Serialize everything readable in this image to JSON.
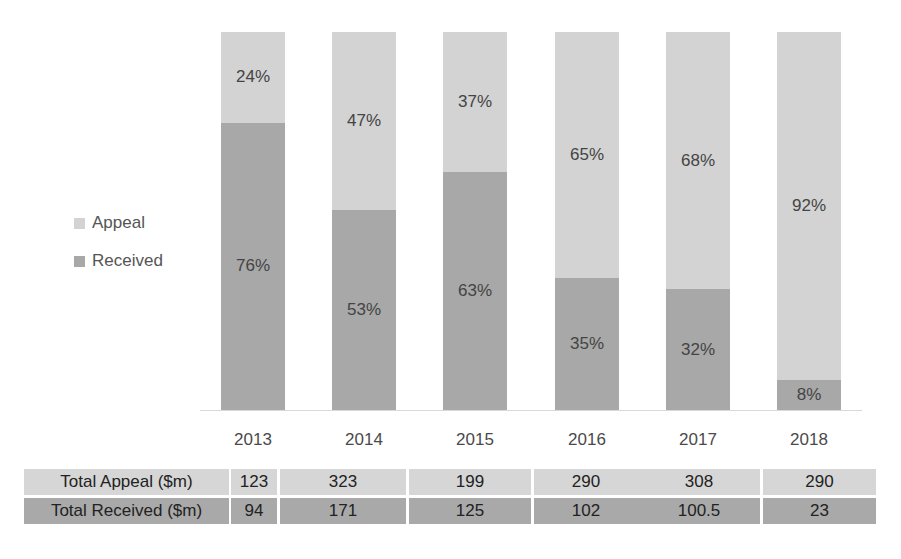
{
  "chart_data": {
    "type": "bar",
    "stacked": true,
    "normalized_percent": true,
    "title": "",
    "xlabel": "",
    "ylabel": "",
    "ylim": [
      0,
      100
    ],
    "grid": false,
    "legend_position": "left",
    "categories": [
      "2013",
      "2014",
      "2015",
      "2016",
      "2017",
      "2018"
    ],
    "series": [
      {
        "name": "Received",
        "color": "#a8a8a8",
        "values": [
          76,
          53,
          63,
          35,
          32,
          8
        ],
        "labels": [
          "76%",
          "53%",
          "63%",
          "35%",
          "32%",
          "8%"
        ]
      },
      {
        "name": "Appeal",
        "color": "#d3d3d3",
        "values": [
          24,
          47,
          37,
          65,
          68,
          92
        ],
        "labels": [
          "24%",
          "47%",
          "37%",
          "65%",
          "68%",
          "92%"
        ]
      }
    ],
    "table": {
      "rows": [
        {
          "label": "Total Appeal ($m)",
          "values": [
            "123",
            "323",
            "199",
            "290",
            "308",
            "290"
          ]
        },
        {
          "label": "Total Received ($m)",
          "values": [
            "94",
            "171",
            "125",
            "102",
            "100.5",
            "23"
          ]
        }
      ]
    }
  },
  "legend": {
    "items": [
      {
        "label": "Appeal",
        "color": "#d3d3d3"
      },
      {
        "label": "Received",
        "color": "#a8a8a8"
      }
    ]
  }
}
